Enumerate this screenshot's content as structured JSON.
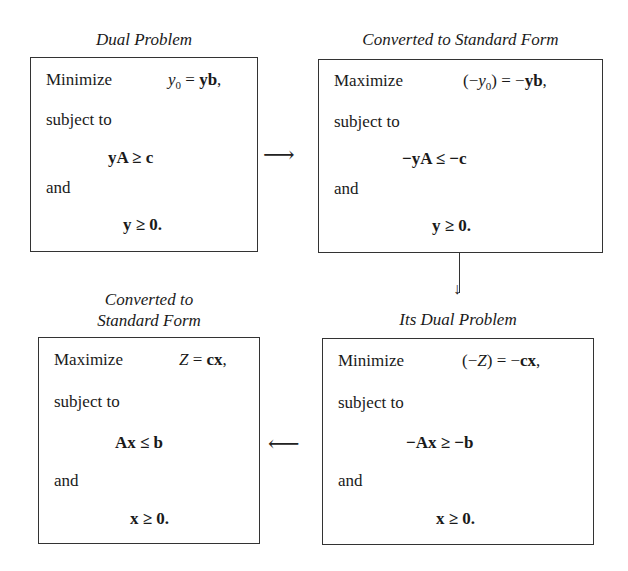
{
  "diagram": {
    "boxes": [
      {
        "id": "dual-problem",
        "title": "Dual Problem",
        "objective_verb": "Minimize",
        "objective_expr": "y0 = yb,",
        "subject_to": "subject to",
        "constraint": "yA ≥ c",
        "and": "and",
        "nonneg": "y ≥ 0."
      },
      {
        "id": "dual-standard-form",
        "title": "Converted to Standard Form",
        "objective_verb": "Maximize",
        "objective_expr": "(−y0) = −yb,",
        "subject_to": "subject to",
        "constraint": "−yA ≤ −c",
        "and": "and",
        "nonneg": "y ≥ 0."
      },
      {
        "id": "its-dual-problem",
        "title": "Its Dual Problem",
        "objective_verb": "Minimize",
        "objective_expr": "(−Z) = −cx,",
        "subject_to": "subject to",
        "constraint": "−Ax ≥ −b",
        "and": "and",
        "nonneg": "x ≥ 0."
      },
      {
        "id": "primal-standard-form",
        "title_line1": "Converted to",
        "title_line2": "Standard Form",
        "objective_verb": "Maximize",
        "objective_expr": "Z = cx,",
        "subject_to": "subject to",
        "constraint": "Ax ≤ b",
        "and": "and",
        "nonneg": "x ≥ 0."
      }
    ],
    "arrows": [
      {
        "from": "dual-problem",
        "to": "dual-standard-form",
        "glyph": "⟶"
      },
      {
        "from": "dual-standard-form",
        "to": "its-dual-problem",
        "glyph": "↓"
      },
      {
        "from": "its-dual-problem",
        "to": "primal-standard-form",
        "glyph": "⟵"
      }
    ]
  }
}
